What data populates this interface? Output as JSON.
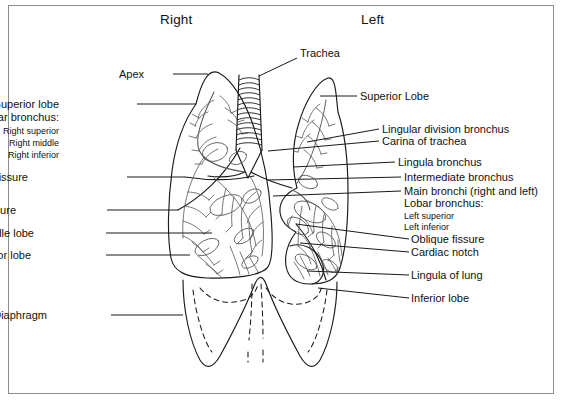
{
  "diagram": {
    "title_hint": "Bronchial tree and lungs, anterior view",
    "headers": [
      {
        "name": "header-right",
        "text": "Right",
        "x": 160,
        "y": 12
      },
      {
        "name": "header-left",
        "text": "Left",
        "x": 361,
        "y": 12
      }
    ],
    "left_labels": [
      {
        "name": "label-apex",
        "text": "Apex",
        "x": 144,
        "y": 69,
        "size": "normal",
        "leader": {
          "x1": 173,
          "y1": 74,
          "x2": 208,
          "y2": 74
        }
      },
      {
        "name": "label-superior-lobe",
        "text": "Superior lobe",
        "x": 59,
        "y": 99,
        "size": "normal",
        "leader": {
          "x1": 137,
          "y1": 104,
          "x2": 196,
          "y2": 104
        }
      },
      {
        "name": "label-lobar-bronchus",
        "text": "Lobar bronchus:",
        "x": 59,
        "y": 112,
        "size": "normal",
        "leader": null
      },
      {
        "name": "label-right-superior",
        "text": "Right superior",
        "x": 59,
        "y": 127,
        "size": "sub",
        "leader": null
      },
      {
        "name": "label-right-middle",
        "text": "Right middle",
        "x": 59,
        "y": 139,
        "size": "sub",
        "leader": null
      },
      {
        "name": "label-right-inferior",
        "text": "Right inferior",
        "x": 59,
        "y": 151,
        "size": "sub",
        "leader": null
      },
      {
        "name": "label-horizontal-fissure",
        "text": "Horizontal fissure",
        "x": 28,
        "y": 172,
        "size": "normal",
        "leader": {
          "x1": 127,
          "y1": 177,
          "x2": 185,
          "y2": 177
        }
      },
      {
        "name": "label-oblique-fissure",
        "text": "Oblique fissure",
        "x": 16,
        "y": 205,
        "size": "normal",
        "leader": {
          "x1": 107,
          "y1": 210,
          "x2": 178,
          "y2": 210
        }
      },
      {
        "name": "label-middle-lobe",
        "text": "Middle lobe",
        "x": 34,
        "y": 228,
        "size": "normal",
        "leader": {
          "x1": 106,
          "y1": 233,
          "x2": 212,
          "y2": 233
        }
      },
      {
        "name": "label-inferior-lobe",
        "text": "Inferior lobe",
        "x": 31,
        "y": 250,
        "size": "normal",
        "leader": {
          "x1": 106,
          "y1": 255,
          "x2": 190,
          "y2": 255
        }
      },
      {
        "name": "label-diaphragm",
        "text": "Diaphragm",
        "x": 47,
        "y": 310,
        "size": "normal",
        "leader": {
          "x1": 111,
          "y1": 315,
          "x2": 183,
          "y2": 315
        }
      }
    ],
    "right_labels": [
      {
        "name": "label-trachea",
        "text": "Trachea",
        "x": 300,
        "y": 48,
        "size": "normal",
        "leader": {
          "x1": 297,
          "y1": 58,
          "x2": 259,
          "y2": 76
        }
      },
      {
        "name": "label-superior-lobe-left",
        "text": "Superior Lobe",
        "x": 360,
        "y": 91,
        "size": "normal",
        "leader": {
          "x1": 357,
          "y1": 96,
          "x2": 320,
          "y2": 96
        }
      },
      {
        "name": "label-lingular-division",
        "text": "Lingular division bronchus",
        "x": 382,
        "y": 124,
        "size": "normal",
        "leader": {
          "x1": 379,
          "y1": 129,
          "x2": 307,
          "y2": 142
        }
      },
      {
        "name": "label-carina-of-trachea",
        "text": "Carina of trachea",
        "x": 382,
        "y": 136,
        "size": "normal",
        "leader": {
          "x1": 379,
          "y1": 141,
          "x2": 268,
          "y2": 151
        }
      },
      {
        "name": "label-lingula-bronchus",
        "text": "Lingula bronchus",
        "x": 398,
        "y": 157,
        "size": "normal",
        "leader": {
          "x1": 395,
          "y1": 162,
          "x2": 293,
          "y2": 167
        }
      },
      {
        "name": "label-intermediate-bronchus",
        "text": "Intermediate bronchus",
        "x": 404,
        "y": 172,
        "size": "normal",
        "leader": {
          "x1": 401,
          "y1": 177,
          "x2": 268,
          "y2": 180
        }
      },
      {
        "name": "label-main-bronchi",
        "text": "Main bronchi (right and left)",
        "x": 404,
        "y": 186,
        "size": "normal",
        "leader": {
          "x1": 401,
          "y1": 191,
          "x2": 273,
          "y2": 196
        }
      },
      {
        "name": "label-lobar-bronchus-left",
        "text": "Lobar bronchus:",
        "x": 404,
        "y": 198,
        "size": "normal",
        "leader": null
      },
      {
        "name": "label-left-superior",
        "text": "Left superior",
        "x": 404,
        "y": 212,
        "size": "sub",
        "leader": null
      },
      {
        "name": "label-left-inferior",
        "text": "Left inferior",
        "x": 404,
        "y": 223,
        "size": "sub",
        "leader": null
      },
      {
        "name": "label-oblique-fissure-left",
        "text": "Oblique fissure",
        "x": 411,
        "y": 234,
        "size": "normal",
        "leader": {
          "x1": 409,
          "y1": 239,
          "x2": 296,
          "y2": 224
        }
      },
      {
        "name": "label-cardiac-notch",
        "text": "Cardiac notch",
        "x": 411,
        "y": 247,
        "size": "normal",
        "leader": {
          "x1": 409,
          "y1": 252,
          "x2": 300,
          "y2": 243
        }
      },
      {
        "name": "label-lingula-of-lung",
        "text": "Lingula of lung",
        "x": 411,
        "y": 270,
        "size": "normal",
        "leader": {
          "x1": 409,
          "y1": 275,
          "x2": 307,
          "y2": 271
        }
      },
      {
        "name": "label-inferior-lobe-left",
        "text": "Inferior lobe",
        "x": 411,
        "y": 293,
        "size": "normal",
        "leader": {
          "x1": 409,
          "y1": 298,
          "x2": 318,
          "y2": 288
        }
      }
    ],
    "colors": {
      "ink": "#1a1a1a",
      "detail": "#555555",
      "frame": "#8d8d8d",
      "page": "#ffffff"
    },
    "structures": [
      {
        "name": "right-lung-outline",
        "interactable": false
      },
      {
        "name": "left-lung-outline",
        "interactable": false
      },
      {
        "name": "trachea-tube",
        "interactable": false
      },
      {
        "name": "trachea-cartilage-rings",
        "count": 14,
        "interactable": false
      },
      {
        "name": "carina",
        "interactable": false
      },
      {
        "name": "right-main-bronchus",
        "interactable": false
      },
      {
        "name": "left-main-bronchus",
        "interactable": false
      },
      {
        "name": "horizontal-fissure-line",
        "interactable": false
      },
      {
        "name": "oblique-fissure-line-right",
        "interactable": false
      },
      {
        "name": "oblique-fissure-line-left",
        "interactable": false
      },
      {
        "name": "cardiac-notch-indent",
        "interactable": false
      },
      {
        "name": "lingula-of-lung-lobule",
        "interactable": false
      },
      {
        "name": "diaphragm-dome-solid",
        "interactable": false
      },
      {
        "name": "diaphragm-dome-dashed",
        "interactable": false
      },
      {
        "name": "bronchial-tree-right",
        "interactable": false
      },
      {
        "name": "bronchial-tree-left",
        "interactable": false
      }
    ]
  }
}
